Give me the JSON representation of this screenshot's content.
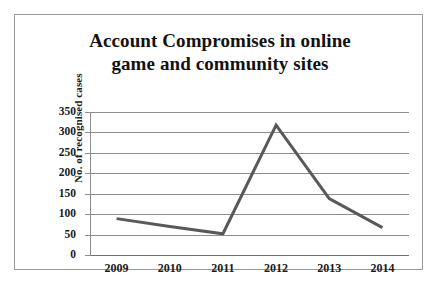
{
  "figure": {
    "background_color": "#ffffff",
    "border_color": "#9a9a9a"
  },
  "chart_data": {
    "type": "line",
    "title": "Account Compromises in online game and community sites",
    "title_lines": [
      "Account Compromises in online",
      "game and community sites"
    ],
    "xlabel": "",
    "ylabel": "No. of recognised cases",
    "categories": [
      "2009",
      "2010",
      "2011",
      "2012",
      "2013",
      "2014"
    ],
    "x": [
      2009,
      2010,
      2011,
      2012,
      2013,
      2014
    ],
    "values": [
      89,
      70,
      52,
      318,
      138,
      67
    ],
    "series": [
      {
        "name": "No. of recognised cases",
        "values": [
          89,
          70,
          52,
          318,
          138,
          67
        ],
        "color": "#595959",
        "line_width": 3,
        "markers": false
      }
    ],
    "ylim": [
      0,
      350
    ],
    "ytick_labels": [
      "0",
      "50",
      "100",
      "150",
      "200",
      "250",
      "300",
      "350"
    ],
    "ytick_values": [
      0,
      50,
      100,
      150,
      200,
      250,
      300,
      350
    ],
    "xtick_labels": [
      "2009",
      "2010",
      "2011",
      "2012",
      "2013",
      "2014"
    ],
    "grid": true,
    "grid_axis": "y",
    "grid_color": "#8d8d8d",
    "legend": false,
    "legend_position": "none",
    "annotations": []
  }
}
